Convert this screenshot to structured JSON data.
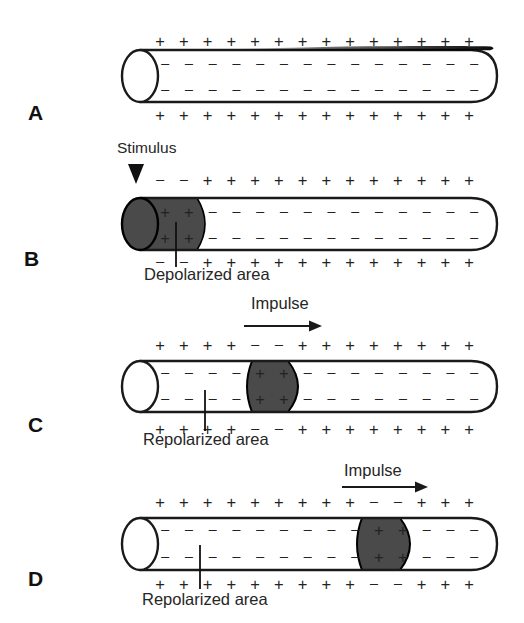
{
  "colors": {
    "background": "#ffffff",
    "ink": "#1a1a1a",
    "depolarized_fill": "#4a4a4a",
    "charge_color": "#222222"
  },
  "panels": [
    {
      "label": "A",
      "band_slots": null,
      "charges": {
        "outer_top": [
          "+",
          "+",
          "+",
          "+",
          "+",
          "+",
          "+",
          "+",
          "+",
          "+",
          "+",
          "+",
          "+",
          "+"
        ],
        "inner_top": [
          "-",
          "-",
          "-",
          "-",
          "-",
          "-",
          "-",
          "-",
          "-",
          "-",
          "-",
          "-",
          "-",
          "-"
        ],
        "inner_bottom": [
          "-",
          "-",
          "-",
          "-",
          "-",
          "-",
          "-",
          "-",
          "-",
          "-",
          "-",
          "-",
          "-",
          "-"
        ],
        "outer_bottom": [
          "+",
          "+",
          "+",
          "+",
          "+",
          "+",
          "+",
          "+",
          "+",
          "+",
          "+",
          "+",
          "+",
          "+"
        ]
      }
    },
    {
      "label": "B",
      "stimulus": "Stimulus",
      "annotation": "Depolarized area",
      "band_slots": [
        0,
        1
      ],
      "charges": {
        "outer_top": [
          "-",
          "-",
          "+",
          "+",
          "+",
          "+",
          "+",
          "+",
          "+",
          "+",
          "+",
          "+",
          "+",
          "+"
        ],
        "inner_top": [
          "+",
          "+",
          "-",
          "-",
          "-",
          "-",
          "-",
          "-",
          "-",
          "-",
          "-",
          "-",
          "-",
          "-"
        ],
        "inner_bottom": [
          "+",
          "+",
          "-",
          "-",
          "-",
          "-",
          "-",
          "-",
          "-",
          "-",
          "-",
          "-",
          "-",
          "-"
        ],
        "outer_bottom": [
          "-",
          "-",
          "+",
          "+",
          "+",
          "+",
          "+",
          "+",
          "+",
          "+",
          "+",
          "+",
          "+",
          "+"
        ]
      }
    },
    {
      "label": "C",
      "impulse": "Impulse",
      "annotation": "Repolarized area",
      "band_slots": [
        4,
        5
      ],
      "charges": {
        "outer_top": [
          "+",
          "+",
          "+",
          "+",
          "-",
          "-",
          "+",
          "+",
          "+",
          "+",
          "+",
          "+",
          "+",
          "+"
        ],
        "inner_top": [
          "-",
          "-",
          "-",
          "-",
          "+",
          "+",
          "-",
          "-",
          "-",
          "-",
          "-",
          "-",
          "-",
          "-"
        ],
        "inner_bottom": [
          "-",
          "-",
          "-",
          "-",
          "+",
          "+",
          "-",
          "-",
          "-",
          "-",
          "-",
          "-",
          "-",
          "-"
        ],
        "outer_bottom": [
          "+",
          "+",
          "+",
          "+",
          "-",
          "-",
          "+",
          "+",
          "+",
          "+",
          "+",
          "+",
          "+",
          "+"
        ]
      }
    },
    {
      "label": "D",
      "impulse": "Impulse",
      "annotation": "Repolarized area",
      "band_slots": [
        9,
        10
      ],
      "charges": {
        "outer_top": [
          "+",
          "+",
          "+",
          "+",
          "+",
          "+",
          "+",
          "+",
          "+",
          "-",
          "-",
          "+",
          "+",
          "+"
        ],
        "inner_top": [
          "-",
          "-",
          "-",
          "-",
          "-",
          "-",
          "-",
          "-",
          "-",
          "+",
          "+",
          "-",
          "-",
          "-"
        ],
        "inner_bottom": [
          "-",
          "-",
          "-",
          "-",
          "-",
          "-",
          "-",
          "-",
          "-",
          "+",
          "+",
          "-",
          "-",
          "-"
        ],
        "outer_bottom": [
          "+",
          "+",
          "+",
          "+",
          "+",
          "+",
          "+",
          "+",
          "+",
          "-",
          "-",
          "+",
          "+",
          "+"
        ]
      }
    }
  ]
}
